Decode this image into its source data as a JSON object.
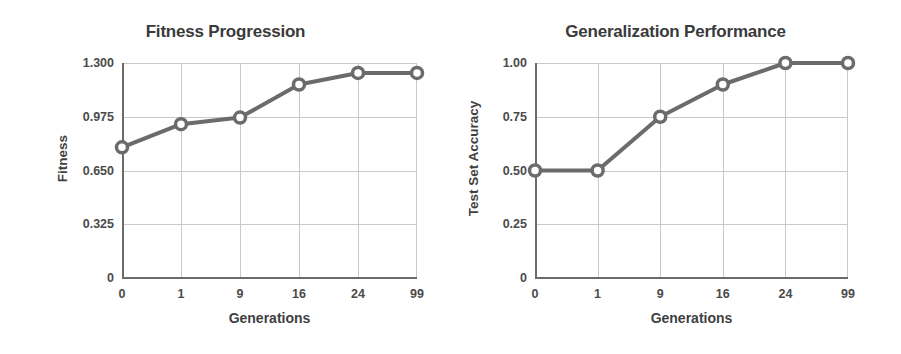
{
  "figure": {
    "width": 901,
    "height": 354,
    "background": "#ffffff",
    "line_color": "#6b6b6b",
    "marker_fill": "#ffffff",
    "grid_color": "#c9c9c9",
    "axis_color": "#6b6b6b",
    "text_color": "#3f3f3f"
  },
  "chart_data": [
    {
      "type": "line",
      "title": "Fitness Progression",
      "xlabel": "Generations",
      "ylabel": "Fitness",
      "categories": [
        "0",
        "1",
        "9",
        "16",
        "24",
        "99"
      ],
      "x": [
        0,
        1,
        9,
        16,
        24,
        99
      ],
      "values": [
        0.79,
        0.93,
        0.97,
        1.17,
        1.24,
        1.24
      ],
      "ylim": [
        0,
        1.3
      ],
      "yticks": [
        0,
        0.325,
        0.65,
        0.975,
        1.3
      ],
      "ytick_labels": [
        "0",
        "0.325",
        "0.650",
        "0.975",
        "1.300"
      ],
      "xtick_labels": [
        "0",
        "1",
        "9",
        "16",
        "24",
        "99"
      ],
      "grid": true,
      "legend": "none",
      "marker": "open-circle",
      "series": [
        {
          "name": "Fitness",
          "values": [
            0.79,
            0.93,
            0.97,
            1.17,
            1.24,
            1.24
          ]
        }
      ]
    },
    {
      "type": "line",
      "title": "Generalization Performance",
      "xlabel": "Generations",
      "ylabel": "Test Set Accuracy",
      "categories": [
        "0",
        "1",
        "9",
        "16",
        "24",
        "99"
      ],
      "x": [
        0,
        1,
        9,
        16,
        24,
        99
      ],
      "values": [
        0.5,
        0.5,
        0.75,
        0.9,
        1.0,
        1.0
      ],
      "ylim": [
        0,
        1.0
      ],
      "yticks": [
        0,
        0.25,
        0.5,
        0.75,
        1.0
      ],
      "ytick_labels": [
        "0",
        "0.25",
        "0.50",
        "0.75",
        "1.00"
      ],
      "xtick_labels": [
        "0",
        "1",
        "9",
        "16",
        "24",
        "99"
      ],
      "grid": true,
      "legend": "none",
      "marker": "open-circle",
      "series": [
        {
          "name": "Test Set Accuracy",
          "values": [
            0.5,
            0.5,
            0.75,
            0.9,
            1.0,
            1.0
          ]
        }
      ]
    }
  ]
}
